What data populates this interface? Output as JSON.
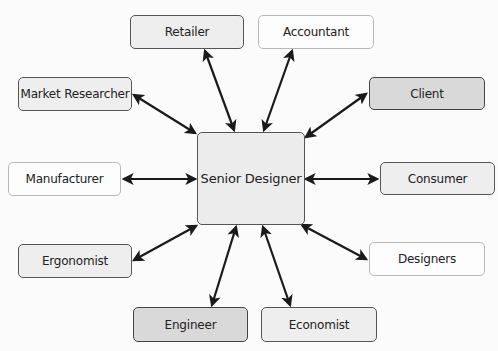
{
  "diagram": {
    "center": {
      "label": "Senior Designer",
      "x": 197,
      "y": 132,
      "w": 108,
      "h": 93,
      "style": "light"
    },
    "nodes": [
      {
        "id": "retailer",
        "label": "Retailer",
        "x": 130,
        "y": 15,
        "w": 114,
        "h": 34,
        "style": "light"
      },
      {
        "id": "accountant",
        "label": "Accountant",
        "x": 258,
        "y": 15,
        "w": 116,
        "h": 34,
        "style": "white"
      },
      {
        "id": "market-researcher",
        "label": "Market Researcher",
        "x": 18,
        "y": 77,
        "w": 114,
        "h": 34,
        "style": "light"
      },
      {
        "id": "client",
        "label": "Client",
        "x": 369,
        "y": 77,
        "w": 116,
        "h": 33,
        "style": "mid"
      },
      {
        "id": "manufacturer",
        "label": "Manufacturer",
        "x": 8,
        "y": 162,
        "w": 113,
        "h": 34,
        "style": "white"
      },
      {
        "id": "consumer",
        "label": "Consumer",
        "x": 380,
        "y": 162,
        "w": 115,
        "h": 33,
        "style": "light"
      },
      {
        "id": "ergonomist",
        "label": "Ergonomist",
        "x": 18,
        "y": 244,
        "w": 114,
        "h": 34,
        "style": "light"
      },
      {
        "id": "designers",
        "label": "Designers",
        "x": 369,
        "y": 242,
        "w": 116,
        "h": 34,
        "style": "white"
      },
      {
        "id": "engineer",
        "label": "Engineer",
        "x": 133,
        "y": 307,
        "w": 115,
        "h": 35,
        "style": "mid"
      },
      {
        "id": "economist",
        "label": "Economist",
        "x": 261,
        "y": 307,
        "w": 116,
        "h": 35,
        "style": "light"
      }
    ],
    "edges": [
      {
        "to": "retailer",
        "x1": 234,
        "y1": 130,
        "x2": 205,
        "y2": 51
      },
      {
        "to": "accountant",
        "x1": 264,
        "y1": 130,
        "x2": 292,
        "y2": 51
      },
      {
        "to": "market-researcher",
        "x1": 195,
        "y1": 133,
        "x2": 134,
        "y2": 95
      },
      {
        "to": "client",
        "x1": 306,
        "y1": 137,
        "x2": 366,
        "y2": 94
      },
      {
        "to": "manufacturer",
        "x1": 195,
        "y1": 179,
        "x2": 124,
        "y2": 179
      },
      {
        "to": "consumer",
        "x1": 306,
        "y1": 179,
        "x2": 377,
        "y2": 179
      },
      {
        "to": "ergonomist",
        "x1": 196,
        "y1": 226,
        "x2": 134,
        "y2": 260
      },
      {
        "to": "designers",
        "x1": 302,
        "y1": 225,
        "x2": 366,
        "y2": 259
      },
      {
        "to": "engineer",
        "x1": 236,
        "y1": 227,
        "x2": 212,
        "y2": 305
      },
      {
        "to": "economist",
        "x1": 263,
        "y1": 227,
        "x2": 290,
        "y2": 305
      }
    ],
    "colors": {
      "arrow": "#1a1a1a",
      "light_fill": "#eeeeee",
      "white_fill": "#fdfdfd",
      "mid_fill": "#d9d9d9",
      "background": "#fbfbfb"
    }
  }
}
